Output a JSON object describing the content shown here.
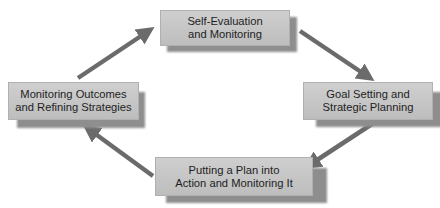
{
  "diagram": {
    "type": "cycle",
    "nodes": [
      {
        "id": "top",
        "line1": "Self-Evaluation",
        "line2": "and Monitoring"
      },
      {
        "id": "right",
        "line1": "Goal Setting and",
        "line2": "Strategic Planning"
      },
      {
        "id": "bottom",
        "line1": "Putting a Plan into",
        "line2": "Action and Monitoring It"
      },
      {
        "id": "left",
        "line1": "Monitoring Outcomes",
        "line2": "and Refining Strategies"
      }
    ],
    "edges": [
      {
        "from": "top",
        "to": "right"
      },
      {
        "from": "right",
        "to": "bottom"
      },
      {
        "from": "bottom",
        "to": "left"
      },
      {
        "from": "left",
        "to": "top"
      }
    ],
    "colors": {
      "box": "#c7c7c7",
      "shadow": "#8e8e8e",
      "arrow": "#6b6b6b",
      "text": "#1e1e1e"
    }
  }
}
